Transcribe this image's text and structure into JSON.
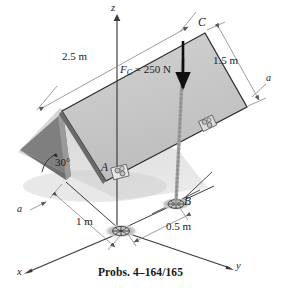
{
  "figure": {
    "caption": "Probs. 4–164/165",
    "colors": {
      "plate_face": "#c9c9c9",
      "plate_edge": "#2a2a2a",
      "shadow": "#b9b9b9",
      "underside": "#8a8a8a",
      "line": "#3a3a3a",
      "dim_line": "#8e8e8e",
      "chain": "#9a9a9a",
      "force_arrow": "#0d0d0d",
      "text": "#1b1b1b"
    },
    "axes": [
      {
        "name": "z-axis",
        "label": "z"
      },
      {
        "name": "x-axis",
        "label": "x"
      },
      {
        "name": "y-axis",
        "label": "y"
      }
    ],
    "points": [
      {
        "name": "point-c",
        "label": "C"
      },
      {
        "name": "point-a",
        "label": "A"
      },
      {
        "name": "point-b",
        "label": "B"
      }
    ],
    "section_labels": [
      {
        "name": "section-a-right",
        "label": "a"
      },
      {
        "name": "section-a-left",
        "label": "a"
      }
    ],
    "dimensions": [
      {
        "name": "dimension-2-5m",
        "label": "2.5 m"
      },
      {
        "name": "dimension-1-5m",
        "label": "1.5 m"
      },
      {
        "name": "dimension-1m",
        "label": "1 m"
      },
      {
        "name": "dimension-0-5m",
        "label": "0.5 m"
      }
    ],
    "angle": {
      "name": "angle-30deg",
      "label": "30°"
    },
    "force": {
      "name": "force-fc",
      "symbol": "F",
      "subscript": "C",
      "equals": " = 250 N",
      "label": "F_C = 250 N",
      "magnitude": 250,
      "unit": "N"
    }
  }
}
